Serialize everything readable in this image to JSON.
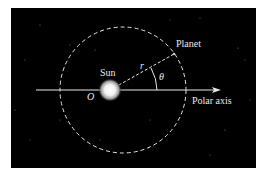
{
  "diagram": {
    "labels": {
      "sun": "Sun",
      "planet": "Planet",
      "origin": "O",
      "radius": "r",
      "angle": "θ",
      "axis": "Polar axis"
    },
    "colors": {
      "background": "#000000",
      "page": "#ffffff",
      "line": "#e6e6e6",
      "text": "#e8e8e8"
    }
  }
}
